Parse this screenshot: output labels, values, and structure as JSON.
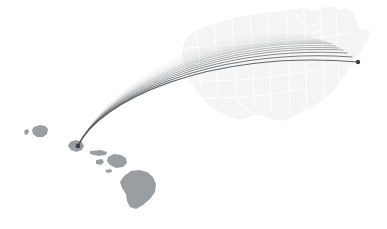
{
  "figure": {
    "title": "Great-circle flight routes from Honolulu, Hawaii to the continental United States",
    "background_color": "#ffffff",
    "width": 387,
    "height": 229
  },
  "chart_data": {
    "type": "map",
    "title": "Great-circle flight routes from Honolulu, Hawaii to the continental United States",
    "subtitle": "",
    "projection": "albers-usa-composite",
    "legend": "none",
    "grid": "off",
    "xlabel": "",
    "ylabel": "",
    "basemap": {
      "land_fill": "#f4f4f5",
      "border_stroke": "#ffffff",
      "hawaii_fill": "#9a9ea0",
      "regions": [
        {
          "name": "continental-united-states",
          "fill": "#f4f4f5",
          "opacity": 0.85
        },
        {
          "name": "hawaii-islands",
          "fill": "#9a9ea0",
          "opacity": 1.0
        }
      ]
    },
    "origin": {
      "name": "Honolulu",
      "state": "HI",
      "x": 78,
      "y": 146
    },
    "destination_primary": {
      "name": "East Coast terminus",
      "x": 358,
      "y": 62,
      "marker": "dot",
      "marker_radius": 2.2,
      "marker_color": "#3f4244"
    },
    "arc_style": {
      "stroke_color": "#53585b",
      "stroke_width_max": 1.15,
      "stroke_width_min": 0.45,
      "opacity_max": 0.92,
      "opacity_min": 0.06,
      "curvature": "great-circle-arc-bowed-north"
    },
    "series": [
      {
        "name": "route-01",
        "weight": 1.0,
        "opacity": 0.92,
        "width": 1.15,
        "apex_y": 46,
        "end_x": 358,
        "end_y": 62
      },
      {
        "name": "route-02",
        "weight": 0.92,
        "opacity": 0.8,
        "width": 1.05,
        "apex_y": 44,
        "end_x": 352,
        "end_y": 57
      },
      {
        "name": "route-03",
        "weight": 0.86,
        "opacity": 0.7,
        "width": 0.98,
        "apex_y": 42,
        "end_x": 347,
        "end_y": 53
      },
      {
        "name": "route-04",
        "weight": 0.8,
        "opacity": 0.6,
        "width": 0.92,
        "apex_y": 40,
        "end_x": 343,
        "end_y": 50
      },
      {
        "name": "route-05",
        "weight": 0.74,
        "opacity": 0.52,
        "width": 0.88,
        "apex_y": 38,
        "end_x": 339,
        "end_y": 48
      },
      {
        "name": "route-06",
        "weight": 0.68,
        "opacity": 0.45,
        "width": 0.84,
        "apex_y": 36,
        "end_x": 336,
        "end_y": 46
      },
      {
        "name": "route-07",
        "weight": 0.62,
        "opacity": 0.38,
        "width": 0.8,
        "apex_y": 34,
        "end_x": 333,
        "end_y": 44
      },
      {
        "name": "route-08",
        "weight": 0.56,
        "opacity": 0.32,
        "width": 0.76,
        "apex_y": 33,
        "end_x": 330,
        "end_y": 43
      },
      {
        "name": "route-09",
        "weight": 0.5,
        "opacity": 0.27,
        "width": 0.72,
        "apex_y": 31,
        "end_x": 327,
        "end_y": 42
      },
      {
        "name": "route-10",
        "weight": 0.44,
        "opacity": 0.22,
        "width": 0.68,
        "apex_y": 30,
        "end_x": 324,
        "end_y": 41
      },
      {
        "name": "route-11",
        "weight": 0.38,
        "opacity": 0.18,
        "width": 0.64,
        "apex_y": 28,
        "end_x": 321,
        "end_y": 40
      },
      {
        "name": "route-12",
        "weight": 0.32,
        "opacity": 0.15,
        "width": 0.6,
        "apex_y": 27,
        "end_x": 318,
        "end_y": 39
      },
      {
        "name": "route-13",
        "weight": 0.26,
        "opacity": 0.12,
        "width": 0.56,
        "apex_y": 25,
        "end_x": 315,
        "end_y": 38
      },
      {
        "name": "route-14",
        "weight": 0.2,
        "opacity": 0.1,
        "width": 0.52,
        "apex_y": 24,
        "end_x": 312,
        "end_y": 37
      },
      {
        "name": "route-15",
        "weight": 0.14,
        "opacity": 0.08,
        "width": 0.48,
        "apex_y": 22,
        "end_x": 309,
        "end_y": 36
      },
      {
        "name": "route-16",
        "weight": 0.08,
        "opacity": 0.06,
        "width": 0.45,
        "apex_y": 21,
        "end_x": 306,
        "end_y": 35
      }
    ],
    "annotations": []
  }
}
